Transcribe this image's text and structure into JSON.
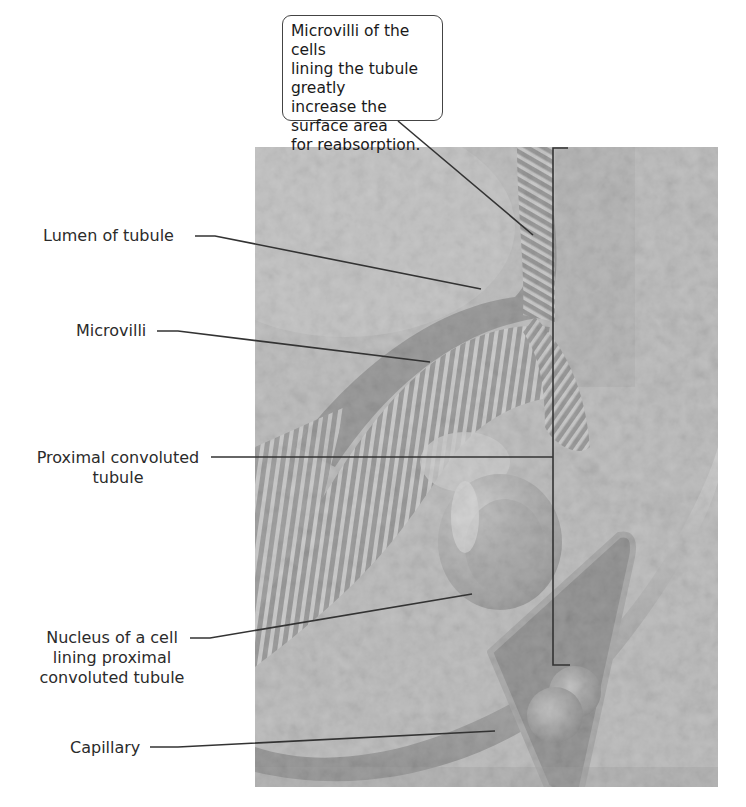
{
  "callout": {
    "lines": [
      "Microvilli of the cells",
      "lining the tubule greatly",
      "increase the surface area",
      "for reabsorption."
    ]
  },
  "labels": {
    "lumen": "Lumen of tubule",
    "microvilli": "Microvilli",
    "proximal_line1": "Proximal convoluted",
    "proximal_line2": "tubule",
    "nucleus_line1": "Nucleus of a cell",
    "nucleus_line2": "lining proximal",
    "nucleus_line3": "convoluted tubule",
    "capillary": "Capillary"
  },
  "image": {
    "description": "Colorized (grayscale) scanning electron micrograph of kidney proximal convoluted tubule showing microvilli, nucleus, and capillary",
    "colors": {
      "background": "#bdbdbd",
      "dark": "#3a3a3a",
      "light": "#efefef",
      "line": "#333333"
    }
  }
}
